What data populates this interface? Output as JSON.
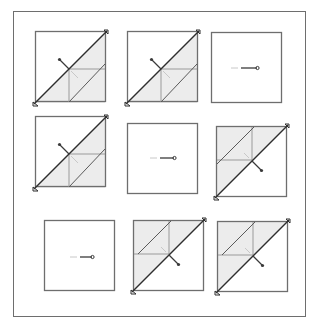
{
  "figure": {
    "type": "3x3 visual pattern puzzle",
    "colors": {
      "frame": "#6e6e6e",
      "line": "#3a3a3a",
      "fill": "#ececec",
      "inner_line": "#9a9a9a",
      "faint": "#c8c8c8"
    },
    "cells": [
      {
        "row": 1,
        "col": 1,
        "variant": "diagonal-fold",
        "orientation": "bottom-right-shaded",
        "pin": "up-left"
      },
      {
        "row": 1,
        "col": 2,
        "variant": "diagonal-fold",
        "orientation": "bottom-right-shaded",
        "pin": "up-left"
      },
      {
        "row": 1,
        "col": 3,
        "variant": "horizontal-pin",
        "pin": "right"
      },
      {
        "row": 2,
        "col": 1,
        "variant": "diagonal-fold",
        "orientation": "bottom-right-shaded",
        "pin": "up-left"
      },
      {
        "row": 2,
        "col": 2,
        "variant": "horizontal-pin",
        "pin": "right"
      },
      {
        "row": 2,
        "col": 3,
        "variant": "diagonal-fold",
        "orientation": "top-left-shaded",
        "pin": "down-right"
      },
      {
        "row": 3,
        "col": 1,
        "variant": "horizontal-pin",
        "pin": "right"
      },
      {
        "row": 3,
        "col": 2,
        "variant": "diagonal-fold",
        "orientation": "top-left-shaded",
        "pin": "down-right"
      },
      {
        "row": 3,
        "col": 3,
        "variant": "diagonal-fold",
        "orientation": "top-left-shaded",
        "pin": "down-right"
      }
    ]
  }
}
